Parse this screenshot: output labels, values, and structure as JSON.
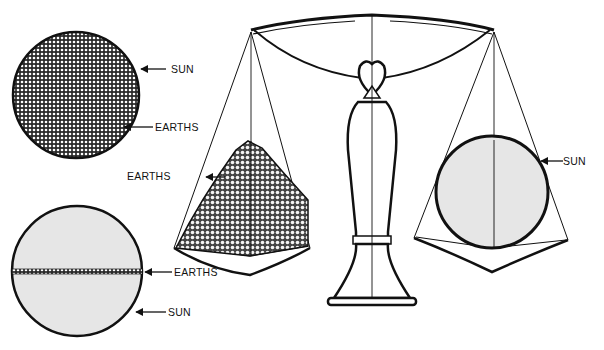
{
  "diagram": {
    "colors": {
      "ink": "#111111",
      "sun_fill_light": "#e6e6e6",
      "stipple_fill": "#3a3a3a",
      "background": "#ffffff"
    },
    "panels": {
      "top_left": {
        "description": "Sun disk filled entirely with Earths",
        "labels": {
          "sun": "SUN",
          "earths": "EARTHS"
        }
      },
      "bottom_left": {
        "description": "Sun disk with a thin band of Earths across its diameter",
        "labels": {
          "earths": "EARTHS",
          "sun": "SUN"
        }
      },
      "scale": {
        "description": "Balance scale: pile of Earths on left pan balances the Sun on right pan",
        "left_pan": {
          "label": "EARTHS"
        },
        "right_pan": {
          "label": "SUN"
        }
      }
    }
  }
}
